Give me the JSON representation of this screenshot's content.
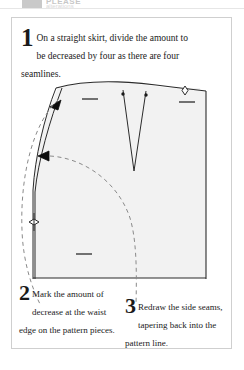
{
  "header": {
    "swatch_color": "#c9c9c9",
    "title": "PLEASE",
    "subtitle": "alterations",
    "rule_color": "#e6e6e6"
  },
  "card": {
    "border_color": "#cfcfcf",
    "background": "#ffffff"
  },
  "steps": [
    {
      "number": "1",
      "text": "On a straight skirt, divide the amount to be decreased by four as there are four seamlines."
    },
    {
      "number": "2",
      "text": "Mark the amount of decrease at the waist edge on the pattern pieces."
    },
    {
      "number": "3",
      "text": "Redraw the side seams, tapering back into the pattern line."
    }
  ],
  "diagram": {
    "fill_color": "#f2f2f2",
    "line_color": "#2b2b2b",
    "dashed_color": "#8a8a8a",
    "elements": [
      "waistline",
      "side-seam-original",
      "side-seam-redrawn",
      "center-back-line",
      "hemline",
      "waist-dart",
      "grainline-marks",
      "notch-diamonds",
      "decrease-arrows",
      "callout-leader-curves"
    ]
  }
}
